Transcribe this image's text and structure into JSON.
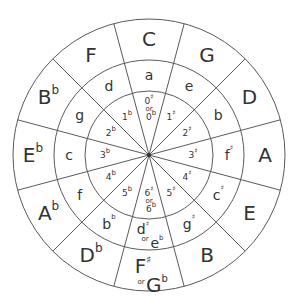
{
  "diagram": {
    "center": [
      149,
      155
    ],
    "radii": {
      "inner": 64,
      "middle": 95,
      "outer": 136
    },
    "colors": {
      "line": "#5a5a5a",
      "text": "#333333",
      "background": "#ffffff"
    },
    "segments": [
      {
        "position": 0,
        "major": {
          "note": "C",
          "acc": ""
        },
        "minor": {
          "note": "a",
          "acc": ""
        },
        "signature": {
          "a": "0",
          "aacc": "♯",
          "or": "or",
          "b": "0",
          "bacc": "b"
        }
      },
      {
        "position": 1,
        "major": {
          "note": "G",
          "acc": ""
        },
        "minor": {
          "note": "e",
          "acc": ""
        },
        "signature": {
          "a": "1",
          "aacc": "♯"
        }
      },
      {
        "position": 2,
        "major": {
          "note": "D",
          "acc": ""
        },
        "minor": {
          "note": "b",
          "acc": ""
        },
        "signature": {
          "a": "2",
          "aacc": "♯"
        }
      },
      {
        "position": 3,
        "major": {
          "note": "A",
          "acc": ""
        },
        "minor": {
          "note": "f",
          "acc": "♯"
        },
        "signature": {
          "a": "3",
          "aacc": "♯"
        }
      },
      {
        "position": 4,
        "major": {
          "note": "E",
          "acc": ""
        },
        "minor": {
          "note": "c",
          "acc": "♯"
        },
        "signature": {
          "a": "4",
          "aacc": "♯"
        }
      },
      {
        "position": 5,
        "major": {
          "note": "B",
          "acc": ""
        },
        "minor": {
          "note": "g",
          "acc": "♯"
        },
        "signature": {
          "a": "5",
          "aacc": "♯"
        }
      },
      {
        "position": 6,
        "major": {
          "note": "F",
          "acc": "♯",
          "or": "or",
          "note2": "G",
          "acc2": "b"
        },
        "minor": {
          "note": "d",
          "acc": "♯",
          "or": "or",
          "note2": "e",
          "acc2": "b"
        },
        "signature": {
          "a": "6",
          "aacc": "♯",
          "or": "or",
          "b": "6",
          "bacc": "b"
        }
      },
      {
        "position": 7,
        "major": {
          "note": "D",
          "acc": "b"
        },
        "minor": {
          "note": "b",
          "acc": "b"
        },
        "signature": {
          "a": "5",
          "aacc": "b"
        }
      },
      {
        "position": 8,
        "major": {
          "note": "A",
          "acc": "b"
        },
        "minor": {
          "note": "f",
          "acc": ""
        },
        "signature": {
          "a": "4",
          "aacc": "b"
        }
      },
      {
        "position": 9,
        "major": {
          "note": "E",
          "acc": "b"
        },
        "minor": {
          "note": "c",
          "acc": ""
        },
        "signature": {
          "a": "3",
          "aacc": "b"
        }
      },
      {
        "position": 10,
        "major": {
          "note": "B",
          "acc": "b"
        },
        "minor": {
          "note": "g",
          "acc": ""
        },
        "signature": {
          "a": "2",
          "aacc": "b"
        }
      },
      {
        "position": 11,
        "major": {
          "note": "F",
          "acc": ""
        },
        "minor": {
          "note": "d",
          "acc": ""
        },
        "signature": {
          "a": "1",
          "aacc": "b"
        }
      }
    ]
  }
}
